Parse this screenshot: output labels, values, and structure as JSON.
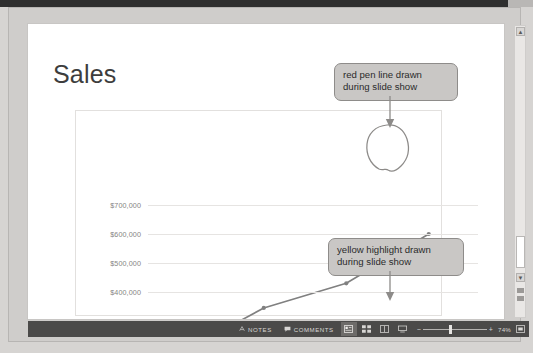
{
  "application": "powerpoint-slide-editor",
  "slide": {
    "title": "Sales"
  },
  "chart_data": {
    "type": "line",
    "title": "Sales",
    "xlabel": "",
    "ylabel": "",
    "categories": [
      "2013",
      "2014",
      "2015",
      "Anticipated 2016"
    ],
    "values": [
      190000,
      345000,
      430000,
      600000
    ],
    "series": [
      {
        "name": "Sales",
        "values": [
          190000,
          345000,
          430000,
          600000
        ]
      }
    ],
    "ylim": [
      100000,
      700000
    ],
    "yticks": [
      "$100,000",
      "$200,000",
      "$300,000",
      "$400,000",
      "$500,000",
      "$600,000",
      "$700,000"
    ],
    "ytick_values": [
      100000,
      200000,
      300000,
      400000,
      500000,
      600000,
      700000
    ],
    "grid": true,
    "legend": false,
    "line_color": "#808080",
    "marker": "circle"
  },
  "annotations": {
    "highlighted_category": "Anticipated 2016",
    "highlight_color": "#f2ee9a",
    "pen_circle_target": "Anticipated 2016",
    "pen_color": "#8a8a8a",
    "callouts": [
      {
        "id": "red-pen-callout",
        "line1": "red pen line drawn",
        "line2": "during slide show"
      },
      {
        "id": "yellow-highlight-callout",
        "line1": "yellow highlight drawn",
        "line2": "during slide show"
      }
    ]
  },
  "statusbar": {
    "notes_label": "NOTES",
    "notes_icon": "notes-icon",
    "comments_label": "COMMENTS",
    "comments_icon": "comment-icon",
    "views": [
      {
        "name": "normal-view",
        "active": true
      },
      {
        "name": "slide-sorter-view",
        "active": false
      },
      {
        "name": "reading-view",
        "active": false
      },
      {
        "name": "slide-show-view",
        "active": false
      }
    ],
    "zoom_out_label": "−",
    "zoom_in_label": "+",
    "zoom_percent": "74%",
    "fit_label": "fit-slide-icon",
    "bar_color": "#4b4a49"
  },
  "scrollbar": {
    "up_arrow": "▲",
    "down_arrow": "▼"
  }
}
